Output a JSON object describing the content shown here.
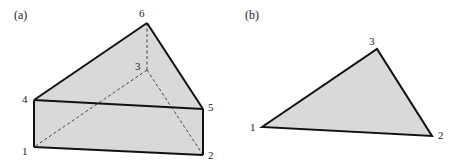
{
  "colors": {
    "fill": "#d9d9d9",
    "stroke": "#111111",
    "hidden_edge": "#444444",
    "text": "#222222"
  },
  "panels": [
    {
      "label": "(a)",
      "shape": "triangular prism",
      "vertices": [
        {
          "id": "1",
          "x": 34,
          "y": 147
        },
        {
          "id": "2",
          "x": 203,
          "y": 155
        },
        {
          "id": "3",
          "x": 147,
          "y": 70
        },
        {
          "id": "4",
          "x": 34,
          "y": 100
        },
        {
          "id": "5",
          "x": 203,
          "y": 109
        },
        {
          "id": "6",
          "x": 147,
          "y": 23
        }
      ],
      "visible_edges": [
        [
          "4",
          "6"
        ],
        [
          "6",
          "5"
        ],
        [
          "4",
          "5"
        ],
        [
          "4",
          "1"
        ],
        [
          "1",
          "2"
        ],
        [
          "5",
          "2"
        ]
      ],
      "hidden_edges": [
        [
          "6",
          "3"
        ],
        [
          "3",
          "1"
        ],
        [
          "3",
          "2"
        ]
      ]
    },
    {
      "label": "(b)",
      "shape": "triangle",
      "vertices": [
        {
          "id": "1",
          "x": 262,
          "y": 127
        },
        {
          "id": "2",
          "x": 432,
          "y": 136
        },
        {
          "id": "3",
          "x": 377,
          "y": 49
        }
      ],
      "visible_edges": [
        [
          "1",
          "3"
        ],
        [
          "3",
          "2"
        ],
        [
          "1",
          "2"
        ]
      ]
    }
  ]
}
